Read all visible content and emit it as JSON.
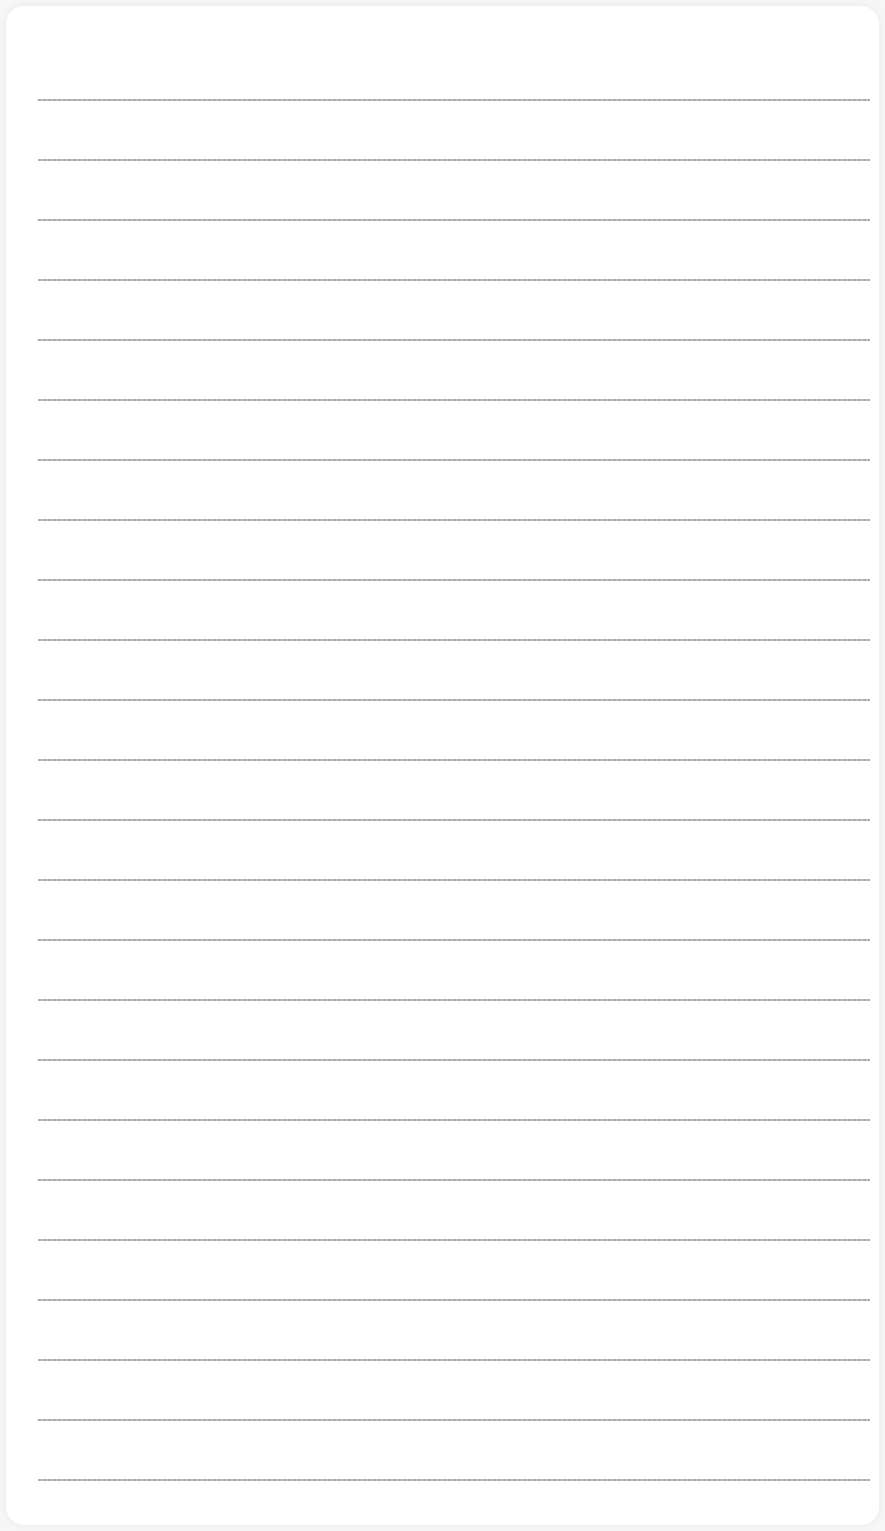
{
  "paper": {
    "type": "lined-paper",
    "line_count": 24,
    "first_line_y": 99,
    "line_spacing": 60,
    "line_color": "#a0a0a0",
    "background_color": "#ffffff"
  }
}
